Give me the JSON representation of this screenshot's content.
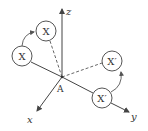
{
  "diagram": {
    "type": "3D coordinate axes with rotation of point X about origin A",
    "colors": {
      "stroke": "#444444",
      "background": "#ffffff",
      "text": "#333333"
    },
    "origin": {
      "label": "A"
    },
    "axes": [
      {
        "name": "z",
        "label": "z"
      },
      {
        "name": "x",
        "label": "x"
      },
      {
        "name": "y",
        "label": "y"
      }
    ],
    "nodes": [
      {
        "id": "x-left",
        "label": "X"
      },
      {
        "id": "x-top",
        "label": "X"
      },
      {
        "id": "xprime-right",
        "label": "X′"
      },
      {
        "id": "xprime-lower",
        "label": "X′"
      }
    ],
    "connections": [
      {
        "from": "A",
        "to": "x-top",
        "style": "dashed"
      },
      {
        "from": "A",
        "to": "xprime-right",
        "style": "dashed"
      },
      {
        "from": "x-left",
        "to": "x-top",
        "style": "curved-arrow"
      },
      {
        "from": "xprime-lower",
        "to": "xprime-right",
        "style": "curved-arrow"
      }
    ]
  }
}
